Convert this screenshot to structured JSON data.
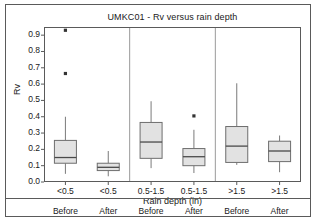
{
  "chart_data": {
    "type": "box",
    "title": "UMKC01 - Rv versus rain depth",
    "xlabel": "Rain depth (in)",
    "ylabel": "Rv",
    "ylim": [
      0.0,
      0.95
    ],
    "yticks": [
      "0.0",
      "0.1",
      "0.2",
      "0.3",
      "0.4",
      "0.5",
      "0.6",
      "0.7",
      "0.8",
      "0.9"
    ],
    "ytick_values": [
      0.0,
      0.1,
      0.2,
      0.3,
      0.4,
      0.5,
      0.6,
      0.7,
      0.8,
      0.9
    ],
    "grid": false,
    "legend": "none",
    "group_separators": 2,
    "categories": [
      {
        "depth": "<0.5",
        "phase": "Before"
      },
      {
        "depth": "<0.5",
        "phase": "After"
      },
      {
        "depth": "0.5-1.5",
        "phase": "Before"
      },
      {
        "depth": "0.5-1.5",
        "phase": "After"
      },
      {
        "depth": ">1.5",
        "phase": "Before"
      },
      {
        "depth": ">1.5",
        "phase": "After"
      }
    ],
    "boxes": [
      {
        "label": "<0.5 Before",
        "whisker_low": 0.05,
        "q1": 0.115,
        "median": 0.15,
        "q3": 0.255,
        "whisker_high": 0.4,
        "outliers": [
          0.665,
          0.93
        ]
      },
      {
        "label": "<0.5 After",
        "whisker_low": 0.035,
        "q1": 0.07,
        "median": 0.09,
        "q3": 0.115,
        "whisker_high": 0.19,
        "outliers": []
      },
      {
        "label": "0.5-1.5 Before",
        "whisker_low": 0.085,
        "q1": 0.145,
        "median": 0.245,
        "q3": 0.365,
        "whisker_high": 0.495,
        "outliers": []
      },
      {
        "label": "0.5-1.5 After",
        "whisker_low": 0.055,
        "q1": 0.1,
        "median": 0.155,
        "q3": 0.205,
        "whisker_high": 0.32,
        "outliers": [
          0.405
        ]
      },
      {
        "label": ">1.5 Before",
        "whisker_low": 0.105,
        "q1": 0.12,
        "median": 0.22,
        "q3": 0.34,
        "whisker_high": 0.605,
        "outliers": []
      },
      {
        "label": ">1.5 After",
        "whisker_low": 0.06,
        "q1": 0.125,
        "median": 0.19,
        "q3": 0.25,
        "whisker_high": 0.285,
        "outliers": []
      }
    ],
    "colors": {
      "box_fill": "#e2e2e2",
      "box_stroke": "#6e6e6e",
      "median_stroke": "#4a4a4a",
      "whisker_stroke": "#7a7a7a",
      "outlier_fill": "#333333",
      "axis_stroke": "#5a5a5a",
      "separator_stroke": "#9a9a9a",
      "text": "#1a1a1a",
      "background": "#ffffff"
    }
  }
}
